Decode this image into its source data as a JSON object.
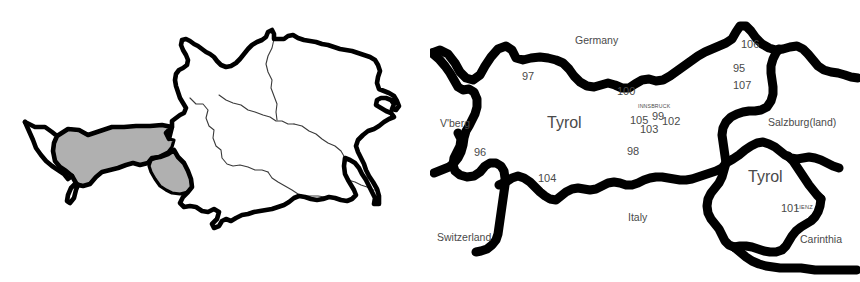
{
  "figure": {
    "background_color": "#ffffff",
    "outline_color": "#000000",
    "highlight_fill": "#b0b0b0",
    "label_color": "#4a4a4a",
    "panels": [
      {
        "name": "austria-overview-map",
        "description": "Outline map of Austria with western states shaded grey",
        "highlighted_regions": [
          "Tyrol",
          "East Tyrol"
        ]
      },
      {
        "name": "tyrol-detail-map",
        "description": "Detail map of Tyrol and East Tyrol with numbered sites"
      }
    ]
  },
  "detail_map": {
    "country_labels": [
      {
        "text": "Germany",
        "x": 145,
        "y": 44
      },
      {
        "text": "V'berg",
        "x": 10,
        "y": 127
      },
      {
        "text": "Switzerland",
        "x": 7,
        "y": 241
      },
      {
        "text": "Italy",
        "x": 198,
        "y": 221
      },
      {
        "text": "Salzburg(land)",
        "x": 338,
        "y": 126
      },
      {
        "text": "Carinthia",
        "x": 370,
        "y": 243
      }
    ],
    "region_labels": [
      {
        "text": "Tyrol",
        "x": 117,
        "y": 128
      },
      {
        "text": "Tyrol",
        "x": 318,
        "y": 182
      }
    ],
    "city_labels": [
      {
        "text": "INNSBRUCK",
        "x": 208,
        "y": 108
      },
      {
        "text": "LIENZ",
        "x": 366,
        "y": 209
      }
    ],
    "site_numbers": [
      {
        "text": "97",
        "x": 92,
        "y": 80
      },
      {
        "text": "100",
        "x": 187,
        "y": 95
      },
      {
        "text": "106",
        "x": 311,
        "y": 48
      },
      {
        "text": "95",
        "x": 303,
        "y": 72
      },
      {
        "text": "107",
        "x": 303,
        "y": 89
      },
      {
        "text": "105",
        "x": 200,
        "y": 124
      },
      {
        "text": "99",
        "x": 222,
        "y": 120
      },
      {
        "text": "102",
        "x": 232,
        "y": 125
      },
      {
        "text": "103",
        "x": 210,
        "y": 133
      },
      {
        "text": "96",
        "x": 44,
        "y": 156
      },
      {
        "text": "98",
        "x": 197,
        "y": 155
      },
      {
        "text": "104",
        "x": 108,
        "y": 182
      },
      {
        "text": "101",
        "x": 351,
        "y": 212
      }
    ]
  }
}
